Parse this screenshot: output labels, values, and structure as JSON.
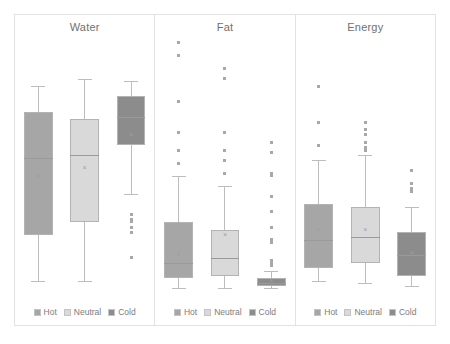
{
  "chart_data": {
    "type": "box",
    "title": "",
    "subtitle": "",
    "xlabel": "",
    "ylabel": "",
    "grid": false,
    "legend_position": "bottom",
    "legend": [
      "Hot",
      "Neutral",
      "Cold"
    ],
    "colors": {
      "hot": "#a6a6a6",
      "neutral": "#d9d9d9",
      "cold": "#8c8c8c",
      "frame": "#e2e2e2",
      "title_text": "#707070",
      "legend_text": "#7c7c7c",
      "whisker": "#bdbdbd",
      "outlier": "#a8a8a8",
      "background": "#ffffff"
    },
    "panels": [
      {
        "title": "Water",
        "ylim": [
          0,
          100
        ],
        "groups": [
          {
            "name": "Hot",
            "color": "#a6a6a6",
            "min": 4,
            "q1": 22,
            "median": 52,
            "mean": 45,
            "q3": 70,
            "max": 80,
            "outliers": []
          },
          {
            "name": "Neutral",
            "color": "#d9d9d9",
            "min": 4,
            "q1": 27,
            "median": 53,
            "mean": 48,
            "q3": 67,
            "max": 83,
            "outliers": []
          },
          {
            "name": "Cold",
            "color": "#8c8c8c",
            "min": 38,
            "q1": 57,
            "median": 68,
            "mean": 61,
            "q3": 76,
            "max": 82,
            "outliers": [
              30,
              28,
              27,
              25,
              23,
              13
            ]
          }
        ]
      },
      {
        "title": "Fat",
        "ylim": [
          0,
          100
        ],
        "groups": [
          {
            "name": "Hot",
            "color": "#a6a6a6",
            "min": 1,
            "q1": 5,
            "median": 11,
            "mean": 14,
            "q3": 27,
            "max": 45,
            "outliers": [
              50,
              55,
              62,
              74,
              92,
              97
            ]
          },
          {
            "name": "Neutral",
            "color": "#d9d9d9",
            "min": 1,
            "q1": 6,
            "median": 13,
            "mean": 22,
            "q3": 24,
            "max": 41,
            "outliers": [
              46,
              51,
              55,
              62,
              83,
              87
            ]
          },
          {
            "name": "Cold",
            "color": "#8c8c8c",
            "min": 1,
            "q1": 2,
            "median": 3,
            "mean": 4,
            "q3": 5,
            "max": 8,
            "outliers": [
              10,
              11,
              12,
              19,
              20,
              25,
              31,
              37,
              45,
              46,
              54,
              58
            ]
          }
        ]
      },
      {
        "title": "Energy",
        "ylim": [
          0,
          100
        ],
        "groups": [
          {
            "name": "Hot",
            "color": "#a6a6a6",
            "min": 4,
            "q1": 9,
            "median": 20,
            "mean": 24,
            "q3": 34,
            "max": 51,
            "outliers": [
              57,
              66,
              80
            ]
          },
          {
            "name": "Neutral",
            "color": "#d9d9d9",
            "min": 3,
            "q1": 11,
            "median": 21,
            "mean": 24,
            "q3": 33,
            "max": 53,
            "outliers": [
              55,
              56,
              58,
              61,
              63,
              66
            ]
          },
          {
            "name": "Cold",
            "color": "#8c8c8c",
            "min": 2,
            "q1": 6,
            "median": 14,
            "mean": 15,
            "q3": 23,
            "max": 33,
            "outliers": [
              39,
              40,
              42,
              47
            ]
          }
        ]
      }
    ]
  }
}
